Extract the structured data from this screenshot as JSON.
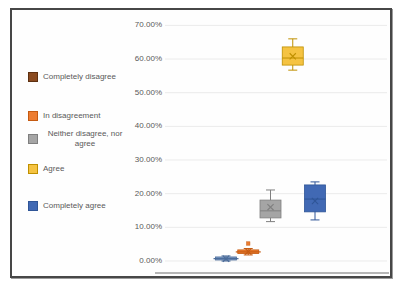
{
  "chart_data": {
    "type": "boxplot",
    "title": "",
    "xlabel": "",
    "ylabel": "",
    "units": "percent",
    "ylim": [
      0,
      70
    ],
    "grid": true,
    "legend_position": "left",
    "yticks": [
      {
        "value": 0,
        "label": "0.00%"
      },
      {
        "value": 10,
        "label": "10.00%"
      },
      {
        "value": 20,
        "label": "20.00%"
      },
      {
        "value": 30,
        "label": "30.00%"
      },
      {
        "value": 40,
        "label": "40.00%"
      },
      {
        "value": 50,
        "label": "50.00%"
      },
      {
        "value": 60,
        "label": "60.00%"
      },
      {
        "value": 70,
        "label": "70.00%"
      }
    ],
    "series": [
      {
        "name": "Completely disagree",
        "legend_color": "#8A4A1F",
        "legend_edge": "#5E3010",
        "box_color": "#7F9EC9",
        "edge_color": "#4A6B99",
        "min": 0,
        "q1": 0.3,
        "median": 0.7,
        "q3": 1.2,
        "max": 1.5,
        "mean": 0.7,
        "outliers": []
      },
      {
        "name": "In disagreement",
        "legend_color": "#ED7D31",
        "legend_edge": "#C55A11",
        "box_color": "#ED7D31",
        "edge_color": "#C55A11",
        "min": 1.8,
        "q1": 2.2,
        "median": 2.7,
        "q3": 3.3,
        "max": 3.7,
        "mean": 2.8,
        "outliers": [
          5.2
        ]
      },
      {
        "name": "Neither disagree, nor agree",
        "legend_color": "#A5A5A5",
        "legend_edge": "#7F7F7F",
        "box_color": "#A5A5A5",
        "edge_color": "#7F7F7F",
        "min": 11.7,
        "q1": 12.8,
        "median": 14.9,
        "q3": 18.1,
        "max": 21.1,
        "mean": 16,
        "outliers": []
      },
      {
        "name": "Agree",
        "legend_color": "#F5C342",
        "legend_edge": "#BF9000",
        "box_color": "#F5C342",
        "edge_color": "#BF9000",
        "min": 56.7,
        "q1": 58.2,
        "median": 60.3,
        "q3": 63.6,
        "max": 66,
        "mean": 60.8,
        "outliers": []
      },
      {
        "name": "Completely agree",
        "legend_color": "#4169B4",
        "legend_edge": "#2F5597",
        "box_color": "#4169B4",
        "edge_color": "#2F5597",
        "min": 12.2,
        "q1": 14.6,
        "median": 18.4,
        "q3": 22.6,
        "max": 23.5,
        "mean": 17.8,
        "outliers": []
      }
    ]
  }
}
